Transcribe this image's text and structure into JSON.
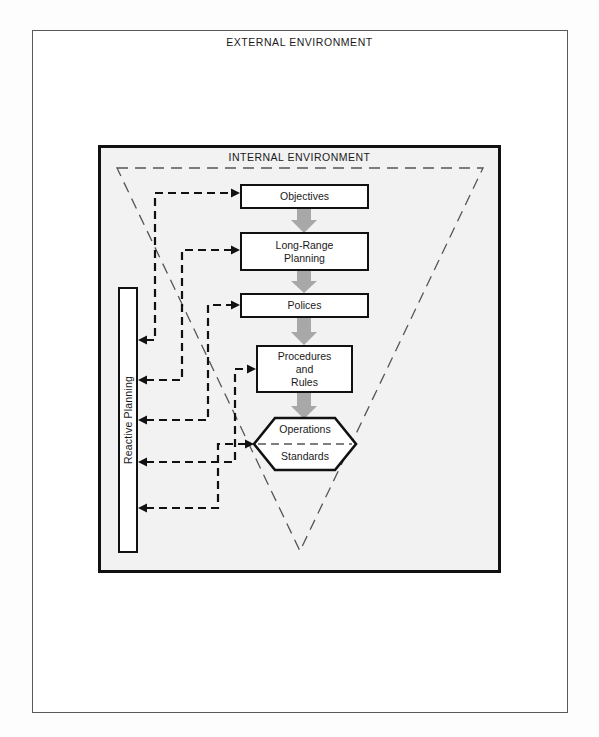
{
  "diagram": {
    "external_label": "EXTERNAL ENVIRONMENT",
    "internal_label": "INTERNAL ENVIRONMENT",
    "reactive_label": "Reactive Planning",
    "boxes": [
      {
        "id": "objectives",
        "label": "Objectives"
      },
      {
        "id": "long-range-planning",
        "label": "Long-Range\nPlanning"
      },
      {
        "id": "policies",
        "label": "Polices"
      },
      {
        "id": "procedures-and-rules",
        "label": "Procedures\nand\nRules"
      }
    ],
    "long_range_line1": "Long-Range",
    "long_range_line2": "Planning",
    "procedures_line1": "Procedures",
    "procedures_line2": "and",
    "procedures_line3": "Rules",
    "hexagon": {
      "top_label": "Operations",
      "bottom_label": "Standards"
    },
    "colors": {
      "page_background": "#fdfdfd",
      "external_frame_stroke": "#5a5a5a",
      "internal_frame_stroke": "#111111",
      "internal_fill": "#f2f2f2",
      "box_stroke": "#111111",
      "box_fill": "#ffffff",
      "flow_arrow_fill": "#a8a8a8",
      "dashed_stroke": "#111111",
      "triangle_stroke": "#555555",
      "text": "#1a1a1a"
    }
  }
}
